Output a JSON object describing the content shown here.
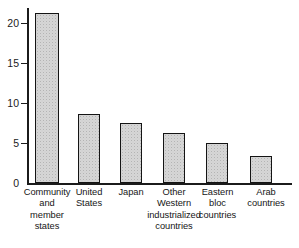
{
  "chart_data": {
    "type": "bar",
    "title": "",
    "subtitle": "",
    "xlabel": "",
    "ylabel": "",
    "ylim": [
      0,
      22
    ],
    "grid": false,
    "legend": false,
    "y_ticks": [
      0,
      5,
      10,
      15,
      20
    ],
    "y_tick_labels": [
      "0",
      "5",
      "10",
      "15",
      "20"
    ],
    "categories": [
      "Community and member states",
      "United States",
      "Japan",
      "Other Western industrialized countries",
      "Eastern bloc countries",
      "Arab countries"
    ],
    "category_lines": [
      [
        "Community",
        "and",
        "member",
        "states"
      ],
      [
        "United",
        "States"
      ],
      [
        "Japan"
      ],
      [
        "Other",
        "Western",
        "industrialized",
        "countries"
      ],
      [
        "Eastern",
        "bloc",
        "countries"
      ],
      [
        "Arab",
        "countries"
      ]
    ],
    "values": [
      21.2,
      8.6,
      7.5,
      6.25,
      5.0,
      3.4
    ],
    "colors": {
      "bar_fill": "#d6d6d6",
      "bar_edge": "#141414",
      "axis": "#1b1b1b",
      "text": "#161616",
      "background": "#ffffff"
    }
  }
}
